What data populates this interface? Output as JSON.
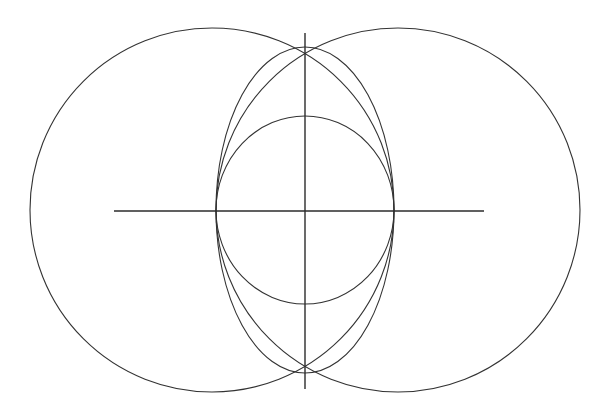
{
  "canvas": {
    "width": 608,
    "height": 420,
    "background": "#ffffff",
    "stroke_color": "#333333",
    "axis_color": "#2b2b2b"
  },
  "figure": {
    "title": ""
  },
  "chart_data": {
    "type": "diagram",
    "title": "",
    "xlabel": "",
    "ylabel": "",
    "coordinate_system": "pixel",
    "origin": {
      "x": 305,
      "y": 210
    },
    "shapes": [
      {
        "name": "left-circle",
        "kind": "circle",
        "cx": 212,
        "cy": 210,
        "r": 182,
        "stroke": "#333333",
        "stroke_width": 1.1,
        "fill": "none"
      },
      {
        "name": "right-circle",
        "kind": "circle",
        "cx": 398,
        "cy": 210,
        "r": 182,
        "stroke": "#333333",
        "stroke_width": 1.1,
        "fill": "none"
      },
      {
        "name": "outer-ellipse",
        "kind": "ellipse",
        "cx": 305,
        "cy": 210,
        "rx": 89,
        "ry": 163,
        "stroke": "#333333",
        "stroke_width": 1.1,
        "fill": "none"
      },
      {
        "name": "inner-ellipse",
        "kind": "ellipse",
        "cx": 305,
        "cy": 210,
        "rx": 89,
        "ry": 94,
        "stroke": "#333333",
        "stroke_width": 1.1,
        "fill": "none"
      }
    ],
    "lines": [
      {
        "name": "horizontal-axis",
        "x1": 114,
        "y1": 211,
        "x2": 484,
        "y2": 211,
        "stroke": "#2b2b2b",
        "stroke_width": 1.4
      },
      {
        "name": "vertical-axis",
        "x1": 305,
        "y1": 33,
        "x2": 305,
        "y2": 389,
        "stroke": "#2b2b2b",
        "stroke_width": 1.4
      }
    ],
    "intersection_points": [
      {
        "name": "top-intersection",
        "x": 305,
        "y": 47
      },
      {
        "name": "bottom-intersection",
        "x": 305,
        "y": 373
      },
      {
        "name": "center",
        "x": 305,
        "y": 210
      }
    ]
  }
}
